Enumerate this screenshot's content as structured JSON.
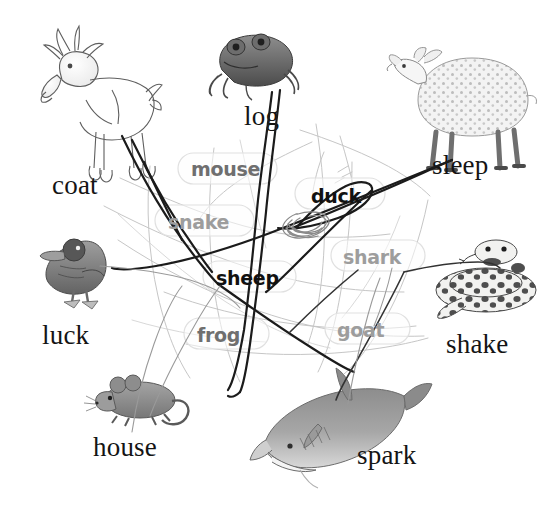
{
  "page": {
    "background_color": "#ffffff",
    "width": 560,
    "height": 516
  },
  "picture_labels": [
    {
      "id": "coat",
      "text": "coat",
      "x": 52,
      "y": 172,
      "animal": "goat-illustration"
    },
    {
      "id": "log",
      "text": "log",
      "x": 244,
      "y": 103,
      "animal": "frog-illustration"
    },
    {
      "id": "sleep",
      "text": "sleep",
      "x": 432,
      "y": 152,
      "animal": "sheep-illustration"
    },
    {
      "id": "luck",
      "text": "luck",
      "x": 42,
      "y": 322,
      "animal": "duck-illustration"
    },
    {
      "id": "shake",
      "text": "shake",
      "x": 446,
      "y": 331,
      "animal": "snake-illustration"
    },
    {
      "id": "house",
      "text": "house",
      "x": 93,
      "y": 434,
      "animal": "mouse-illustration"
    },
    {
      "id": "spark",
      "text": "spark",
      "x": 357,
      "y": 442,
      "animal": "shark-illustration"
    }
  ],
  "word_tiles": [
    {
      "id": "mouse",
      "text": "mouse",
      "x": 191,
      "y": 160,
      "tone": "mid",
      "box": {
        "x": 178,
        "y": 153,
        "w": 99,
        "h": 31
      }
    },
    {
      "id": "duck",
      "text": "duck",
      "x": 311,
      "y": 187,
      "tone": "dark",
      "box": {
        "x": 295,
        "y": 178,
        "w": 90,
        "h": 31
      }
    },
    {
      "id": "snake",
      "text": "snake",
      "x": 168,
      "y": 213,
      "tone": "light",
      "box": {
        "x": 155,
        "y": 205,
        "w": 99,
        "h": 31
      }
    },
    {
      "id": "shark",
      "text": "shark",
      "x": 343,
      "y": 248,
      "tone": "light",
      "box": {
        "x": 331,
        "y": 240,
        "w": 94,
        "h": 31
      }
    },
    {
      "id": "sheep",
      "text": "sheep",
      "x": 216,
      "y": 269,
      "tone": "dark",
      "box": {
        "x": 203,
        "y": 261,
        "w": 93,
        "h": 31
      }
    },
    {
      "id": "frog",
      "text": "frog",
      "x": 197,
      "y": 326,
      "tone": "mid",
      "box": {
        "x": 184,
        "y": 318,
        "w": 85,
        "h": 31
      }
    },
    {
      "id": "goat",
      "text": "goat",
      "x": 337,
      "y": 321,
      "tone": "light",
      "box": {
        "x": 325,
        "y": 313,
        "w": 85,
        "h": 31
      }
    }
  ],
  "colors": {
    "ink_black": "#141414",
    "stroke_dark": "#1a1a1a",
    "stroke_mid": "#6f6f6f",
    "stroke_light": "#b8b8b8",
    "tile_outline": "#dcdcdc",
    "scribble": "#8a8a8a"
  },
  "icons": {
    "goat": "goat-icon",
    "frog": "frog-icon",
    "sheep": "sheep-icon",
    "duck": "duck-icon",
    "snake": "snake-icon",
    "mouse": "mouse-icon",
    "shark": "shark-icon"
  }
}
